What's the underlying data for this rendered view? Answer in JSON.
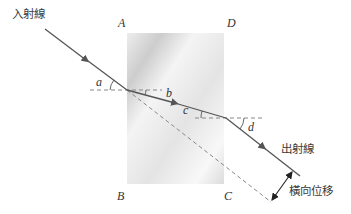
{
  "diagram": {
    "labels": {
      "incident_ray": "入射線",
      "emergent_ray": "出射線",
      "lateral_shift": "橫向位移"
    },
    "vertices": {
      "A": "A",
      "B": "B",
      "C": "C",
      "D": "D"
    },
    "angles": {
      "a": "a",
      "b": "b",
      "c": "c",
      "d": "d"
    },
    "colors": {
      "ray": "#555555",
      "dashed": "#888888",
      "glass_light": "#f7f7f7",
      "glass_dark": "#cfcfcf",
      "text": "#333333"
    }
  }
}
